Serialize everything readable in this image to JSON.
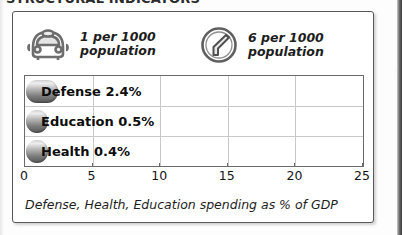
{
  "page": {
    "cut_off_headline": "STRUCTURAL INDICATORS"
  },
  "panel": {
    "legend": [
      {
        "icon": "car-icon",
        "text": "1 per 1000\npopulation",
        "value": 1,
        "per": 1000,
        "unit": "population",
        "subject": "cars"
      },
      {
        "icon": "telephone-icon",
        "text": "6 per 1000\npopulation",
        "value": 6,
        "per": 1000,
        "unit": "population",
        "subject": "telephones"
      }
    ],
    "caption": "Defense, Health, Education spending as % of GDP"
  },
  "chart_data": {
    "type": "bar",
    "orientation": "horizontal",
    "title": "",
    "subtitle": "",
    "xlabel": "",
    "ylabel": "",
    "xlim": [
      0,
      25
    ],
    "grid": true,
    "legend_position": "none",
    "categories": [
      "Defense",
      "Education",
      "Health"
    ],
    "values": [
      2.4,
      0.5,
      0.4
    ],
    "value_unit": "%",
    "bar_labels": [
      "Defense 2.4%",
      "Education 0.5%",
      "Health 0.4%"
    ],
    "tick_labels": [
      "0",
      "5",
      "10",
      "15",
      "20",
      "25"
    ],
    "ticks": [
      0,
      5,
      10,
      15,
      20,
      25
    ],
    "annotation": "Defense, Health, Education spending as % of GDP"
  },
  "colors": {
    "frame": "#585858",
    "bar_dark": "#585858",
    "bar_light": "#efefef",
    "grid": "#c9c9c9",
    "text": "#0d0d0d",
    "background": "#ffffff"
  }
}
